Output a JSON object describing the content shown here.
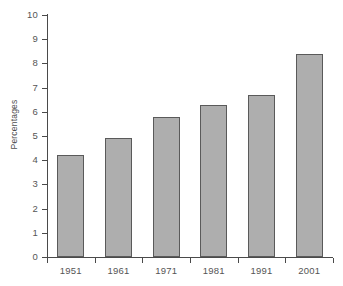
{
  "chart_data": {
    "type": "bar",
    "title": "",
    "subtitle": "",
    "xlabel": "",
    "ylabel": "Percentages",
    "categories": [
      "1951",
      "1961",
      "1971",
      "1981",
      "1991",
      "2001"
    ],
    "values": [
      4.2,
      4.9,
      5.8,
      6.3,
      6.7,
      8.4
    ],
    "series": [
      {
        "name": "Percentages",
        "values": [
          4.2,
          4.9,
          5.8,
          6.3,
          6.7,
          8.4
        ]
      }
    ],
    "ylim": [
      0,
      10
    ],
    "ytick_labels": [
      "10",
      "9",
      "8",
      "7",
      "6",
      "5",
      "4",
      "3",
      "2",
      "1",
      "0"
    ],
    "ytick_values": [
      10,
      9,
      8,
      7,
      6,
      5,
      4,
      3,
      2,
      1,
      0
    ],
    "grid": false,
    "legend": false,
    "legend_position": "none",
    "annotations": [],
    "colors": {
      "bar_fill": "#aeaeae",
      "bar_border": "#5a5a5a",
      "axis": "#4a4a4a",
      "text": "#555555",
      "background": "#ffffff"
    }
  }
}
